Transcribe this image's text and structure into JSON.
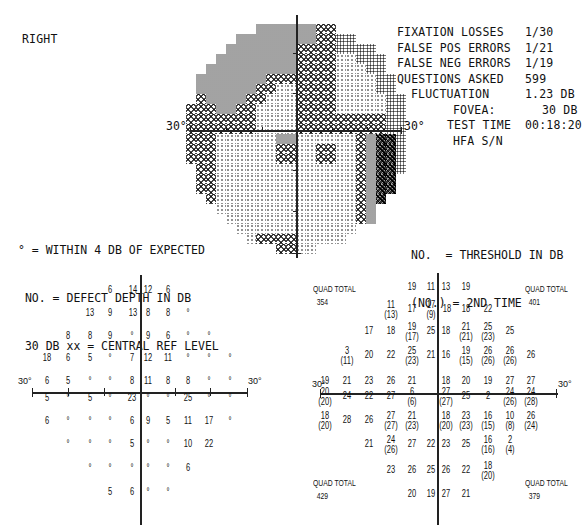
{
  "eye": "RIGHT",
  "reliability": {
    "lines": [
      {
        "label": "FIXATION LOSSES",
        "value": "1/30"
      },
      {
        "label": "FALSE POS ERRORS",
        "value": "1/21"
      },
      {
        "label": "FALSE NEG ERRORS",
        "value": "1/19"
      },
      {
        "label": "QUESTIONS ASKED",
        "value": "599"
      },
      {
        "label": "FLUCTUATION",
        "value": "1.23 DB"
      },
      {
        "label": "FOVEA:",
        "value": "30 DB"
      },
      {
        "label": "TEST TIME",
        "value": "00:18:20"
      },
      {
        "label": "HFA S/N",
        "value": ""
      }
    ]
  },
  "grayscale": {
    "axis_label_left": "30°",
    "axis_label_right": "30°",
    "tones_legend": [
      "t0 light dots",
      "t1 dense dots",
      "t2 crosshatch",
      "t3 dark gray",
      "t4 black"
    ]
  },
  "legend_left": {
    "line1": "° = WITHIN 4 DB OF EXPECTED",
    "line2": " NO. = DEFECT DEPTH IN DB",
    "line3": " 30 DB xx = CENTRAL REF LEVEL"
  },
  "legend_right": {
    "line1": "NO.  = THRESHOLD IN DB",
    "line2": "(NO.) = 2ND TIME"
  },
  "defect_grid": {
    "axis_label_left": "30°",
    "axis_label_right": "30°",
    "rows": [
      {
        "y": 290,
        "cells": [
          {
            "x": 110,
            "v": "6"
          },
          {
            "x": 133,
            "v": "14"
          },
          {
            "x": 148,
            "v": "12"
          },
          {
            "x": 168,
            "v": "6"
          }
        ]
      },
      {
        "y": 313,
        "cells": [
          {
            "x": 90,
            "v": "13"
          },
          {
            "x": 110,
            "v": "9"
          },
          {
            "x": 133,
            "v": "13"
          },
          {
            "x": 148,
            "v": "8"
          },
          {
            "x": 168,
            "v": "8"
          },
          {
            "x": 188,
            "v": "°"
          }
        ]
      },
      {
        "y": 336,
        "cells": [
          {
            "x": 68,
            "v": "8"
          },
          {
            "x": 90,
            "v": "8"
          },
          {
            "x": 110,
            "v": "9"
          },
          {
            "x": 132,
            "v": "°"
          },
          {
            "x": 148,
            "v": "9"
          },
          {
            "x": 168,
            "v": "6"
          },
          {
            "x": 188,
            "v": "°"
          },
          {
            "x": 209,
            "v": "°"
          }
        ]
      },
      {
        "y": 358,
        "cells": [
          {
            "x": 47,
            "v": "18"
          },
          {
            "x": 68,
            "v": "6"
          },
          {
            "x": 90,
            "v": "5"
          },
          {
            "x": 110,
            "v": "°"
          },
          {
            "x": 132,
            "v": "7"
          },
          {
            "x": 148,
            "v": "12"
          },
          {
            "x": 168,
            "v": "11"
          },
          {
            "x": 188,
            "v": "°"
          },
          {
            "x": 209,
            "v": "°"
          },
          {
            "x": 230,
            "v": "°"
          }
        ]
      },
      {
        "y": 381,
        "cells": [
          {
            "x": 47,
            "v": "6"
          },
          {
            "x": 68,
            "v": "5"
          },
          {
            "x": 90,
            "v": "°"
          },
          {
            "x": 110,
            "v": "°"
          },
          {
            "x": 132,
            "v": "8"
          },
          {
            "x": 148,
            "v": "11"
          },
          {
            "x": 168,
            "v": "8"
          },
          {
            "x": 188,
            "v": "8"
          },
          {
            "x": 209,
            "v": "°"
          },
          {
            "x": 230,
            "v": "°"
          }
        ]
      },
      {
        "y": 398,
        "cells": [
          {
            "x": 47,
            "v": "5"
          },
          {
            "x": 68,
            "v": "°"
          },
          {
            "x": 90,
            "v": "5"
          },
          {
            "x": 110,
            "v": "°"
          },
          {
            "x": 132,
            "v": "23"
          },
          {
            "x": 148,
            "v": "°"
          },
          {
            "x": 168,
            "v": "°"
          },
          {
            "x": 188,
            "v": "25"
          },
          {
            "x": 209,
            "v": "°"
          },
          {
            "x": 230,
            "v": "°"
          }
        ]
      },
      {
        "y": 421,
        "cells": [
          {
            "x": 47,
            "v": "6"
          },
          {
            "x": 68,
            "v": "°"
          },
          {
            "x": 90,
            "v": "°"
          },
          {
            "x": 110,
            "v": "°"
          },
          {
            "x": 132,
            "v": "6"
          },
          {
            "x": 148,
            "v": "9"
          },
          {
            "x": 168,
            "v": "5"
          },
          {
            "x": 188,
            "v": "11"
          },
          {
            "x": 209,
            "v": "17"
          },
          {
            "x": 230,
            "v": "°"
          }
        ]
      },
      {
        "y": 444,
        "cells": [
          {
            "x": 68,
            "v": "°"
          },
          {
            "x": 90,
            "v": "°"
          },
          {
            "x": 110,
            "v": "°"
          },
          {
            "x": 132,
            "v": "5"
          },
          {
            "x": 148,
            "v": "°"
          },
          {
            "x": 168,
            "v": "°"
          },
          {
            "x": 188,
            "v": "10"
          },
          {
            "x": 209,
            "v": "22"
          }
        ]
      },
      {
        "y": 468,
        "cells": [
          {
            "x": 90,
            "v": "°"
          },
          {
            "x": 110,
            "v": "°"
          },
          {
            "x": 132,
            "v": "°"
          },
          {
            "x": 148,
            "v": "°"
          },
          {
            "x": 168,
            "v": "°"
          },
          {
            "x": 188,
            "v": "6"
          }
        ]
      },
      {
        "y": 492,
        "cells": [
          {
            "x": 110,
            "v": "5"
          },
          {
            "x": 132,
            "v": "6"
          },
          {
            "x": 148,
            "v": "°"
          },
          {
            "x": 168,
            "v": "°"
          }
        ]
      }
    ]
  },
  "threshold_grid": {
    "axis_label_left": "30°",
    "axis_label_right": "30°",
    "quads": [
      {
        "label": "QUAD TOTAL",
        "value": "354",
        "x": 313,
        "y": 283
      },
      {
        "label": "QUAD TOTAL",
        "value": "401",
        "x": 525,
        "y": 283
      },
      {
        "label": "QUAD TOTAL",
        "value": "429",
        "x": 313,
        "y": 477
      },
      {
        "label": "QUAD TOTAL",
        "value": "379",
        "x": 525,
        "y": 477
      }
    ],
    "rows": [
      {
        "y": 287,
        "cells": [
          {
            "x": 412,
            "v": "19"
          },
          {
            "x": 431,
            "v": "11"
          },
          {
            "x": 446,
            "v": "13"
          },
          {
            "x": 466,
            "v": "19"
          }
        ]
      },
      {
        "y": 309,
        "cells": [
          {
            "x": 391,
            "v": "11",
            "s": "(13)"
          },
          {
            "x": 412,
            "v": "17"
          },
          {
            "x": 431,
            "v": "17",
            "s": "(9)"
          },
          {
            "x": 447,
            "v": "18"
          },
          {
            "x": 466,
            "v": "18"
          },
          {
            "x": 488,
            "v": "22"
          }
        ]
      },
      {
        "y": 331,
        "cells": [
          {
            "x": 369,
            "v": "17"
          },
          {
            "x": 391,
            "v": "18"
          },
          {
            "x": 412,
            "v": "19",
            "s": "(17)"
          },
          {
            "x": 431,
            "v": "25"
          },
          {
            "x": 446,
            "v": "18"
          },
          {
            "x": 466,
            "v": "21",
            "s": "(21)"
          },
          {
            "x": 488,
            "v": "25",
            "s": "(23)"
          },
          {
            "x": 510,
            "v": "25"
          }
        ]
      },
      {
        "y": 355,
        "cells": [
          {
            "x": 347,
            "v": "3",
            "s": "(11)"
          },
          {
            "x": 369,
            "v": "20"
          },
          {
            "x": 391,
            "v": "22"
          },
          {
            "x": 412,
            "v": "25",
            "s": "(23)"
          },
          {
            "x": 431,
            "v": "21"
          },
          {
            "x": 446,
            "v": "16"
          },
          {
            "x": 466,
            "v": "19",
            "s": "(15)"
          },
          {
            "x": 488,
            "v": "26",
            "s": "(26)"
          },
          {
            "x": 510,
            "v": "26",
            "s": "(26)"
          },
          {
            "x": 531,
            "v": "26"
          }
        ]
      },
      {
        "y": 381,
        "cells": [
          {
            "x": 325,
            "v": "19"
          },
          {
            "x": 347,
            "v": "21"
          },
          {
            "x": 369,
            "v": "23"
          },
          {
            "x": 391,
            "v": "26"
          },
          {
            "x": 412,
            "v": "21"
          },
          {
            "x": 446,
            "v": "18"
          },
          {
            "x": 466,
            "v": "20"
          },
          {
            "x": 488,
            "v": "19"
          },
          {
            "x": 510,
            "v": "27"
          },
          {
            "x": 531,
            "v": "27"
          }
        ]
      },
      {
        "y": 396,
        "cells": [
          {
            "x": 325,
            "v": "20",
            "s": "(20)"
          },
          {
            "x": 347,
            "v": "24"
          },
          {
            "x": 369,
            "v": "22"
          },
          {
            "x": 391,
            "v": "27"
          },
          {
            "x": 412,
            "v": "6",
            "s": "(6)"
          },
          {
            "x": 446,
            "v": "27",
            "s": "(27)"
          },
          {
            "x": 466,
            "v": "25"
          },
          {
            "x": 488,
            "v": "2"
          },
          {
            "x": 510,
            "v": "24",
            "s": "(26)"
          },
          {
            "x": 531,
            "v": "24",
            "s": "(28)"
          }
        ]
      },
      {
        "y": 420,
        "cells": [
          {
            "x": 325,
            "v": "18",
            "s": "(20)"
          },
          {
            "x": 347,
            "v": "28"
          },
          {
            "x": 369,
            "v": "26"
          },
          {
            "x": 391,
            "v": "27",
            "s": "(27)"
          },
          {
            "x": 412,
            "v": "21",
            "s": "(23)"
          },
          {
            "x": 446,
            "v": "18",
            "s": "(20)"
          },
          {
            "x": 466,
            "v": "23",
            "s": "(23)"
          },
          {
            "x": 488,
            "v": "16",
            "s": "(15)"
          },
          {
            "x": 510,
            "v": "10",
            "s": "(8)"
          },
          {
            "x": 531,
            "v": "26",
            "s": "(24)"
          }
        ]
      },
      {
        "y": 444,
        "cells": [
          {
            "x": 369,
            "v": "21"
          },
          {
            "x": 391,
            "v": "24",
            "s": "(26)"
          },
          {
            "x": 412,
            "v": "27"
          },
          {
            "x": 431,
            "v": "22"
          },
          {
            "x": 446,
            "v": "23"
          },
          {
            "x": 466,
            "v": "25"
          },
          {
            "x": 488,
            "v": "16",
            "s": "(16)"
          },
          {
            "x": 510,
            "v": "2",
            "s": "(4)"
          }
        ]
      },
      {
        "y": 470,
        "cells": [
          {
            "x": 391,
            "v": "23"
          },
          {
            "x": 412,
            "v": "26"
          },
          {
            "x": 431,
            "v": "25"
          },
          {
            "x": 446,
            "v": "26"
          },
          {
            "x": 466,
            "v": "22"
          },
          {
            "x": 488,
            "v": "18",
            "s": "(20)"
          }
        ]
      },
      {
        "y": 494,
        "cells": [
          {
            "x": 412,
            "v": "20"
          },
          {
            "x": 431,
            "v": "19"
          },
          {
            "x": 446,
            "v": "27"
          },
          {
            "x": 466,
            "v": "21"
          }
        ]
      }
    ],
    "first_row_note": "Row at 30° line values 27 above (29) near x=510"
  }
}
